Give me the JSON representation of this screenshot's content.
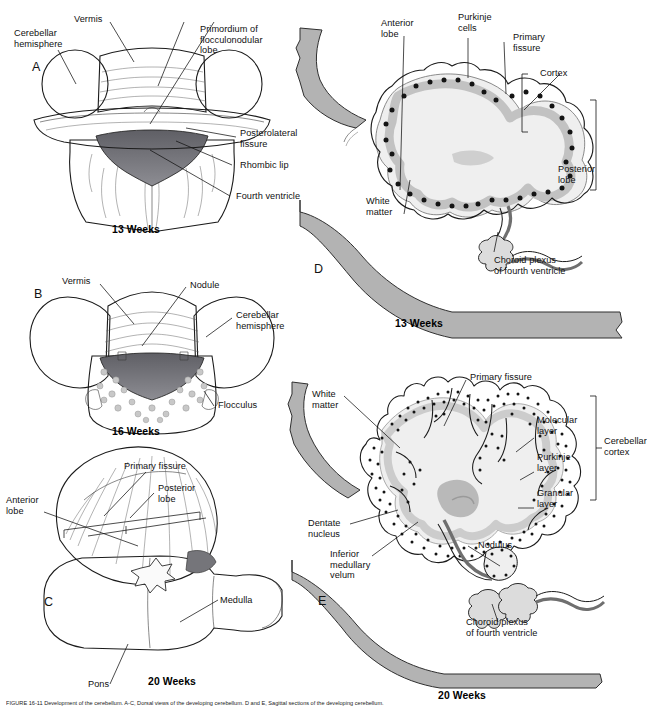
{
  "figure": {
    "caption": "FIGURE 16-11 Development of the cerebellum. A-C, Dorsal views of the developing cerebellum. D and E, Sagittal sections of the developing cerebellum.",
    "colors": {
      "brainstem_gray": "#b3b3b3",
      "cortex_band": "#c9c9c9",
      "white_matter": "#efefef",
      "ventricle_dark": "#6e6e73",
      "outline": "#1b1b1b",
      "text": "#111111"
    }
  },
  "panels": [
    {
      "id": "A",
      "letter": "A",
      "age": "13 Weeks",
      "view": "dorsal",
      "labels": [
        {
          "key": "vermis",
          "text": "Vermis"
        },
        {
          "key": "cerebellar_hemisphere",
          "text": "Cerebellar\nhemisphere"
        },
        {
          "key": "primordium_flocculonodular_lobe",
          "text": "Primordium of\nflocculonodular\nlobe"
        },
        {
          "key": "posterolateral_fissure",
          "text": "Posterolateral\nfissure"
        },
        {
          "key": "rhombic_lip",
          "text": "Rhombic lip"
        },
        {
          "key": "fourth_ventricle",
          "text": "Fourth ventricle"
        }
      ]
    },
    {
      "id": "B",
      "letter": "B",
      "age": "16 Weeks",
      "view": "dorsal",
      "labels": [
        {
          "key": "vermis",
          "text": "Vermis"
        },
        {
          "key": "nodule",
          "text": "Nodule"
        },
        {
          "key": "cerebellar_hemisphere",
          "text": "Cerebellar\nhemisphere"
        },
        {
          "key": "flocculus",
          "text": "Flocculus"
        }
      ]
    },
    {
      "id": "C",
      "letter": "C",
      "age": "20 Weeks",
      "view": "dorsal",
      "labels": [
        {
          "key": "primary_fissure",
          "text": "Primary fissure"
        },
        {
          "key": "anterior_lobe",
          "text": "Anterior\nlobe"
        },
        {
          "key": "posterior_lobe",
          "text": "Posterior\nlobe"
        },
        {
          "key": "medulla",
          "text": "Medulla"
        },
        {
          "key": "pons",
          "text": "Pons"
        }
      ]
    },
    {
      "id": "D",
      "letter": "D",
      "age": "13 Weeks",
      "view": "sagittal",
      "labels": [
        {
          "key": "anterior_lobe",
          "text": "Anterior\nlobe"
        },
        {
          "key": "purkinje_cells",
          "text": "Purkinje\ncells"
        },
        {
          "key": "primary_fissure",
          "text": "Primary\nfissure"
        },
        {
          "key": "cortex",
          "text": "Cortex"
        },
        {
          "key": "posterior_lobe",
          "text": "Posterior\nlobe"
        },
        {
          "key": "white_matter",
          "text": "White\nmatter"
        },
        {
          "key": "choroid_plexus",
          "text": "Choroid plexus\nof fourth ventricle"
        }
      ]
    },
    {
      "id": "E",
      "letter": "E",
      "age": "20 Weeks",
      "view": "sagittal",
      "labels": [
        {
          "key": "primary_fissure",
          "text": "Primary fissure"
        },
        {
          "key": "white_matter",
          "text": "White\nmatter"
        },
        {
          "key": "molecular_layer",
          "text": "Molecular\nlayer"
        },
        {
          "key": "purkinje_layer",
          "text": "Purkinje\nlayer"
        },
        {
          "key": "granular_layer",
          "text": "Granular\nlayer"
        },
        {
          "key": "cerebellar_cortex",
          "text": "Cerebellar\ncortex"
        },
        {
          "key": "dentate_nucleus",
          "text": "Dentate\nnucleus"
        },
        {
          "key": "inferior_medullary_velum",
          "text": "Inferior\nmedullary\nvelum"
        },
        {
          "key": "nodulus",
          "text": "Nodulus"
        },
        {
          "key": "choroid_plexus",
          "text": "Choroid plexus\nof fourth ventricle"
        }
      ]
    }
  ]
}
